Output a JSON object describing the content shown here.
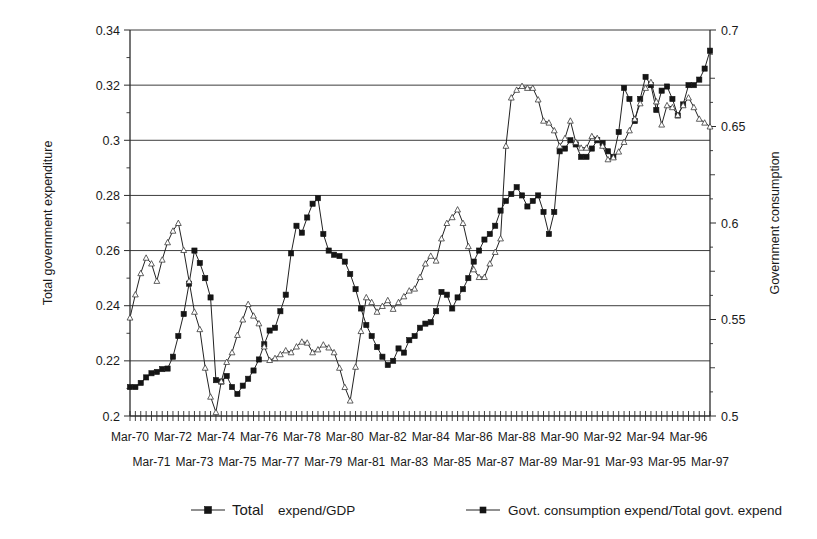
{
  "chart_data": {
    "type": "line",
    "title": "",
    "xlabel": "",
    "ylabel": "Total government expenditure",
    "y2label": "Government consumption",
    "ylim": [
      0.2,
      0.34
    ],
    "y2lim": [
      0.5,
      0.7
    ],
    "yticks": [
      "0.2",
      "0.22",
      "0.24",
      "0.26",
      "0.28",
      "0.3",
      "0.32",
      "0.34"
    ],
    "ytick_values": [
      0.2,
      0.22,
      0.24,
      0.26,
      0.28,
      0.3,
      0.32,
      0.34
    ],
    "y2ticks": [
      "0.5",
      "0.55",
      "0.6",
      "0.65",
      "0.7"
    ],
    "y2tick_values": [
      0.5,
      0.55,
      0.6,
      0.65,
      0.7
    ],
    "grid": true,
    "grid_axis": "y",
    "legend_position": "bottom",
    "xtick_labels_row1": [
      "Mar-70",
      "Mar-72",
      "Mar-74",
      "Mar-76",
      "Mar-78",
      "Mar-80",
      "Mar-82",
      "Mar-84",
      "Mar-86",
      "Mar-88",
      "Mar-90",
      "Mar-92",
      "Mar-94",
      "Mar-96"
    ],
    "xtick_labels_row2": [
      "Mar-71",
      "Mar-73",
      "Mar-75",
      "Mar-77",
      "Mar-79",
      "Mar-81",
      "Mar-83",
      "Mar-85",
      "Mar-87",
      "Mar-89",
      "Mar-91",
      "Mar-93",
      "Mar-95",
      "Mar-97"
    ],
    "x_start_label": "Mar-70",
    "x_end_label": "Mar-97",
    "x_count": 109,
    "series": [
      {
        "name": "Total expend/GDP",
        "axis": "left",
        "marker": "filled-square",
        "values": [
          0.2105,
          0.2105,
          0.212,
          0.214,
          0.2155,
          0.216,
          0.217,
          0.2172,
          0.2215,
          0.229,
          0.237,
          0.248,
          0.26,
          0.2555,
          0.25,
          0.243,
          0.213,
          0.2125,
          0.2145,
          0.2105,
          0.208,
          0.211,
          0.2135,
          0.2165,
          0.2205,
          0.226,
          0.231,
          0.232,
          0.238,
          0.244,
          0.259,
          0.269,
          0.2665,
          0.272,
          0.277,
          0.279,
          0.266,
          0.26,
          0.2585,
          0.258,
          0.256,
          0.2515,
          0.246,
          0.239,
          0.233,
          0.229,
          0.225,
          0.2215,
          0.2185,
          0.22,
          0.2245,
          0.223,
          0.2275,
          0.229,
          0.232,
          0.2335,
          0.234,
          0.238,
          0.245,
          0.244,
          0.239,
          0.243,
          0.246,
          0.25,
          0.256,
          0.26,
          0.264,
          0.266,
          0.269,
          0.2745,
          0.278,
          0.2805,
          0.283,
          0.28,
          0.276,
          0.278,
          0.28,
          0.274,
          0.266,
          0.274,
          0.296,
          0.297,
          0.3,
          0.2985,
          0.294,
          0.294,
          0.297,
          0.3,
          0.299,
          0.296,
          0.294,
          0.303,
          0.319,
          0.315,
          0.307,
          0.315,
          0.323,
          0.32,
          0.311,
          0.318,
          0.3195,
          0.315,
          0.309,
          0.313,
          0.32,
          0.32,
          0.322,
          0.326,
          0.3325
        ]
      },
      {
        "name": "Govt. consumption expend/Total govt. expend",
        "axis": "right",
        "marker": "open-triangle",
        "values": [
          0.551,
          0.563,
          0.574,
          0.582,
          0.579,
          0.57,
          0.581,
          0.59,
          0.596,
          0.6,
          0.586,
          0.57,
          0.554,
          0.545,
          0.525,
          0.51,
          0.502,
          0.518,
          0.528,
          0.533,
          0.542,
          0.55,
          0.558,
          0.552,
          0.548,
          0.536,
          0.529,
          0.53,
          0.532,
          0.534,
          0.533,
          0.536,
          0.5385,
          0.538,
          0.533,
          0.5345,
          0.537,
          0.5355,
          0.533,
          0.525,
          0.515,
          0.508,
          0.5255,
          0.544,
          0.5615,
          0.559,
          0.554,
          0.557,
          0.56,
          0.5555,
          0.559,
          0.562,
          0.565,
          0.566,
          0.572,
          0.579,
          0.583,
          0.5805,
          0.592,
          0.6,
          0.603,
          0.607,
          0.6,
          0.588,
          0.576,
          0.572,
          0.572,
          0.579,
          0.585,
          0.592,
          0.64,
          0.665,
          0.669,
          0.671,
          0.67,
          0.67,
          0.664,
          0.653,
          0.652,
          0.648,
          0.64,
          0.644,
          0.653,
          0.642,
          0.639,
          0.639,
          0.645,
          0.644,
          0.64,
          0.633,
          0.634,
          0.637,
          0.642,
          0.648,
          0.654,
          0.662,
          0.67,
          0.673,
          0.663,
          0.651,
          0.661,
          0.66,
          0.656,
          0.661,
          0.665,
          0.66,
          0.654,
          0.652,
          0.65
        ]
      }
    ]
  },
  "legend": {
    "items": [
      {
        "label_strong": "Total",
        "label_rest": " expend/GDP",
        "marker": "filled-square"
      },
      {
        "label_strong": "",
        "label_rest": "Govt. consumption expend/Total govt. expend",
        "marker": "filled-square-small"
      }
    ]
  },
  "colors": {
    "background": "#ffffff",
    "ink": "#1a1a1a",
    "grid": "#3d3d3d",
    "series1": "#151515",
    "series2": "#3a3a3a"
  }
}
